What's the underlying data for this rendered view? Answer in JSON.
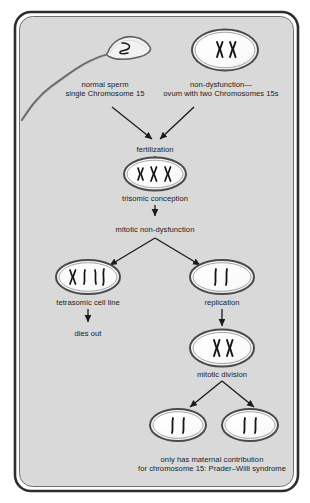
{
  "figure": {
    "frame": {
      "border_color": "#2b2b2b",
      "fill_color": "#d9d9d9",
      "page_color": "#ffffff"
    },
    "cell_style": {
      "membrane_outer": "#4a4a4a",
      "membrane_inner": "#8c8c8c",
      "cytoplasm": "#f7f7f7",
      "chromosome_color": "#1a1a1a"
    }
  },
  "labels": {
    "sperm": "normal sperm\nsingle Chromosome 15",
    "ovum": "non-dysfunction—\novum with two Chromosomes 15s",
    "fertilization": "fertilization",
    "trisomic_conception": "trisomic conception",
    "mitotic_non_dysfunction": "mitotic non-dysfunction",
    "tetrasomic": "tetrasomic cell line",
    "dies_out": "dies out",
    "replication": "replication",
    "mitotic_division": "mitotic division",
    "outcome": "only has maternal contribution\nfor chromosome 15: Prader–Willi syndrome"
  },
  "cells": [
    {
      "id": "sperm-cell",
      "name": "normal sperm",
      "chromosome_count": 1,
      "label_key": "sperm"
    },
    {
      "id": "ovum-cell",
      "name": "ovum with two Chromosomes 15s",
      "chromosome_count": 2,
      "label_key": "ovum"
    },
    {
      "id": "zygote-cell",
      "name": "trisomic conception",
      "chromosome_count": 3,
      "label_key": "trisomic_conception"
    },
    {
      "id": "tetrasomic-cell",
      "name": "tetrasomic cell line",
      "chromosome_count": 4,
      "label_key": "tetrasomic"
    },
    {
      "id": "replication-cell",
      "name": "replication",
      "chromosome_count": 2,
      "label_key": "replication"
    },
    {
      "id": "mitotic-division-cell",
      "name": "mitotic division",
      "chromosome_count": 2,
      "label_key": "mitotic_division"
    },
    {
      "id": "daughter-cell-left",
      "name": "daughter cell left",
      "chromosome_count": 2,
      "label_key": "outcome"
    },
    {
      "id": "daughter-cell-right",
      "name": "daughter cell right",
      "chromosome_count": 2,
      "label_key": "outcome"
    }
  ],
  "flow": [
    {
      "from": "sperm-cell",
      "to": "fertilization"
    },
    {
      "from": "ovum-cell",
      "to": "fertilization"
    },
    {
      "from": "fertilization",
      "to": "zygote-cell"
    },
    {
      "from": "trisomic_conception",
      "to": "mitotic_non_dysfunction"
    },
    {
      "from": "mitotic_non_dysfunction",
      "to": "tetrasomic-cell"
    },
    {
      "from": "mitotic_non_dysfunction",
      "to": "replication-cell"
    },
    {
      "from": "tetrasomic-cell",
      "to": "dies_out"
    },
    {
      "from": "replication-cell",
      "to": "mitotic-division-cell"
    },
    {
      "from": "mitotic-division-cell",
      "to": "daughter-cell-left"
    },
    {
      "from": "mitotic-division-cell",
      "to": "daughter-cell-right"
    }
  ]
}
